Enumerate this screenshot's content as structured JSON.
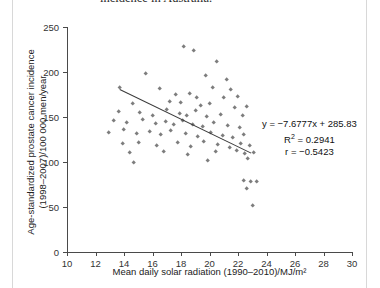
{
  "caption": {
    "line1": "incidence in Australia."
  },
  "chart_data": {
    "type": "scatter",
    "title": "",
    "xlabel": "Mean daily solar radiation (1990–2010)/MJ/m²",
    "ylabel_line1": "Age-standardized prostate cancer incidence",
    "ylabel_line2": "(1998–2007)/100 000 men/year",
    "xlim": [
      10,
      30
    ],
    "ylim": [
      0,
      250
    ],
    "xticks": [
      10,
      12,
      14,
      16,
      18,
      20,
      22,
      24,
      26,
      28,
      30
    ],
    "yticks": [
      0,
      50,
      100,
      150,
      200,
      250
    ],
    "grid": false,
    "legend": "none",
    "marker_color": "#7d7d7d",
    "line_color": "#3a3a3a",
    "annotations": {
      "equation": "y = −7.6777x + 285.83",
      "r_squared_label": "R",
      "r_squared_sup": "2",
      "r_squared_value": " = 0.2941",
      "correlation": "r = −0.5423"
    },
    "trendline": {
      "slope": -7.6777,
      "intercept": 285.83,
      "x_start": 13.7,
      "x_end": 22.9,
      "y_start": 180.6,
      "y_end": 110.0
    },
    "points": [
      [
        18.2,
        228
      ],
      [
        18.9,
        224
      ],
      [
        20.5,
        212
      ],
      [
        15.5,
        198
      ],
      [
        19.7,
        196
      ],
      [
        21.2,
        192
      ],
      [
        13.7,
        183
      ],
      [
        16.5,
        181
      ],
      [
        20.2,
        183
      ],
      [
        21.5,
        180
      ],
      [
        17.6,
        175
      ],
      [
        18.6,
        176
      ],
      [
        19.1,
        172
      ],
      [
        21.0,
        171
      ],
      [
        22.0,
        173
      ],
      [
        14.6,
        165
      ],
      [
        17.2,
        167
      ],
      [
        18.0,
        166
      ],
      [
        19.4,
        163
      ],
      [
        20.0,
        165
      ],
      [
        21.8,
        160
      ],
      [
        22.6,
        162
      ],
      [
        13.6,
        156
      ],
      [
        15.1,
        155
      ],
      [
        16.0,
        152
      ],
      [
        17.0,
        158
      ],
      [
        17.9,
        154
      ],
      [
        18.4,
        151
      ],
      [
        19.0,
        157
      ],
      [
        19.8,
        150
      ],
      [
        20.8,
        153
      ],
      [
        22.3,
        152
      ],
      [
        13.3,
        146
      ],
      [
        14.2,
        144
      ],
      [
        15.3,
        147
      ],
      [
        16.2,
        143
      ],
      [
        16.9,
        145
      ],
      [
        17.5,
        141
      ],
      [
        18.1,
        146
      ],
      [
        18.8,
        142
      ],
      [
        19.5,
        139
      ],
      [
        20.3,
        144
      ],
      [
        21.3,
        140
      ],
      [
        22.1,
        138
      ],
      [
        12.9,
        133
      ],
      [
        14.0,
        136
      ],
      [
        14.9,
        131
      ],
      [
        15.8,
        134
      ],
      [
        16.6,
        130
      ],
      [
        17.3,
        135
      ],
      [
        18.3,
        132
      ],
      [
        19.2,
        128
      ],
      [
        20.1,
        133
      ],
      [
        20.9,
        129
      ],
      [
        21.6,
        127
      ],
      [
        22.4,
        130
      ],
      [
        13.9,
        120
      ],
      [
        15.0,
        122
      ],
      [
        16.3,
        118
      ],
      [
        17.8,
        121
      ],
      [
        18.7,
        117
      ],
      [
        19.6,
        123
      ],
      [
        20.6,
        119
      ],
      [
        21.4,
        116
      ],
      [
        22.2,
        120
      ],
      [
        22.8,
        118
      ],
      [
        14.4,
        110
      ],
      [
        16.8,
        112
      ],
      [
        18.5,
        108
      ],
      [
        20.4,
        111
      ],
      [
        21.9,
        113
      ],
      [
        22.5,
        109
      ],
      [
        23.1,
        110
      ],
      [
        14.7,
        99
      ],
      [
        19.9,
        102
      ],
      [
        22.7,
        104
      ],
      [
        22.4,
        79
      ],
      [
        22.9,
        78
      ],
      [
        23.3,
        78
      ],
      [
        22.6,
        70
      ],
      [
        23.0,
        51
      ]
    ]
  }
}
